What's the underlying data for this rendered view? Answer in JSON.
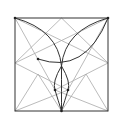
{
  "diagram": {
    "type": "geometric-construction",
    "square": {
      "x1": 15,
      "y1": 18,
      "x2": 108,
      "y2": 111
    },
    "colors": {
      "dark": "#333333",
      "light": "#aaaaaa",
      "point": "#222222"
    },
    "points": [
      {
        "x": 15,
        "y": 18
      },
      {
        "x": 108,
        "y": 18
      },
      {
        "x": 38,
        "y": 59
      },
      {
        "x": 55,
        "y": 90
      },
      {
        "x": 68,
        "y": 90
      },
      {
        "x": 61.5,
        "y": 111
      }
    ]
  }
}
